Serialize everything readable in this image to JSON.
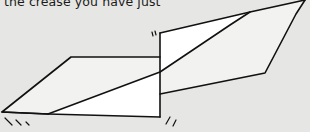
{
  "caption": "the crease you have just",
  "colors": {
    "background": "#e6e6e4",
    "paper_fill": "#ffffff",
    "shaded_fill": "#f1f1ef",
    "stroke": "#111111"
  },
  "diagram": {
    "shapes": [
      {
        "name": "left-panel",
        "points": [
          [
            2,
            112
          ],
          [
            71,
            57
          ],
          [
            160,
            57
          ],
          [
            160,
            117
          ],
          [
            48,
            114
          ]
        ]
      },
      {
        "name": "center-panel",
        "points": [
          [
            160,
            33
          ],
          [
            250,
            12
          ],
          [
            160,
            72
          ]
        ]
      },
      {
        "name": "right-panel",
        "points": [
          [
            250,
            12
          ],
          [
            305,
            0
          ],
          [
            265,
            73
          ],
          [
            160,
            94
          ],
          [
            160,
            72
          ]
        ]
      }
    ],
    "crease": [
      [
        48,
        114
      ],
      [
        160,
        72
      ],
      [
        230,
        25
      ],
      [
        250,
        12
      ]
    ],
    "motion_marks": [
      "upper-center",
      "lower-left",
      "lower-center"
    ]
  }
}
